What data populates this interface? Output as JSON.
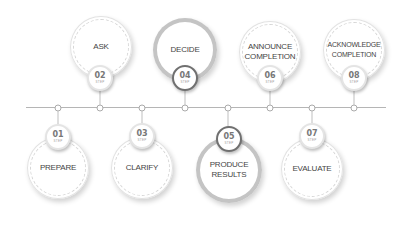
{
  "diagram": {
    "type": "timeline",
    "step_word": "STEP",
    "steps": [
      {
        "num": "01",
        "label": "PREPARE",
        "position": "below"
      },
      {
        "num": "02",
        "label": "ASK",
        "position": "above"
      },
      {
        "num": "03",
        "label": "CLARIFY",
        "position": "below"
      },
      {
        "num": "04",
        "label": "DECIDE",
        "position": "above"
      },
      {
        "num": "05",
        "label": "PRODUCE\nRESULTS",
        "position": "below"
      },
      {
        "num": "06",
        "label": "ANNOUNCE\nCOMPLETION",
        "position": "above"
      },
      {
        "num": "07",
        "label": "EVALUATE",
        "position": "below"
      },
      {
        "num": "08",
        "label": "ACKNOWLEDGE\nCOMPLETION",
        "position": "above"
      }
    ]
  }
}
